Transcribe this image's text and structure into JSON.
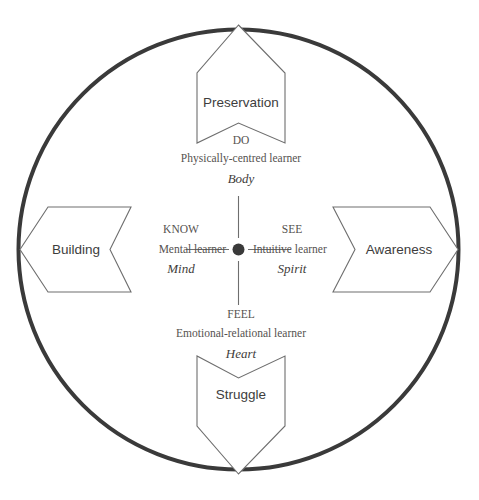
{
  "diagram": {
    "shape": "circle",
    "center_marker": "hub-dot",
    "colors": {
      "circle_stroke": "#3a3a3a",
      "arrow_stroke": "#6e6e6e",
      "arrow_fill": "#ffffff",
      "arrow_label_text": "#3d3d3d",
      "radial_text": "#55524f",
      "essence_text": "#3f3d3b",
      "hub_dot": "#3a3a3a",
      "background": "#ffffff"
    },
    "quadrants": [
      {
        "direction": "top",
        "arrow_label": "Preservation",
        "verb": "DO",
        "learner": "Physically-centred learner",
        "essence": "Body"
      },
      {
        "direction": "right",
        "arrow_label": "Awareness",
        "verb": "SEE",
        "learner": "Intuitive learner",
        "essence": "Spirit"
      },
      {
        "direction": "bottom",
        "arrow_label": "Struggle",
        "verb": "FEEL",
        "learner": "Emotional-relational learner",
        "essence": "Heart"
      },
      {
        "direction": "left",
        "arrow_label": "Building",
        "verb": "KNOW",
        "learner": "Mental learner",
        "essence": "Mind"
      }
    ]
  }
}
